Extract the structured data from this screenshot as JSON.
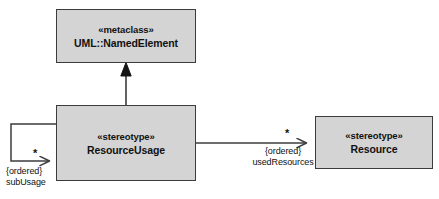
{
  "diagram": {
    "type": "uml-class-diagram",
    "colors": {
      "box_fill": "#d4d4d4",
      "box_stroke": "#3c3c3c",
      "line": "#3c3c3c",
      "text": "#111111",
      "background": "#ffffff"
    },
    "nodes": [
      {
        "id": "metaclass",
        "stereotype": "«metaclass»",
        "name": "UML::NamedElement"
      },
      {
        "id": "resourceusage",
        "stereotype": "«stereotype»",
        "name": "ResourceUsage"
      },
      {
        "id": "resource",
        "stereotype": "«stereotype»",
        "name": "Resource"
      }
    ],
    "edges": [
      {
        "id": "extension",
        "kind": "generalization",
        "from": "resourceusage",
        "to": "metaclass",
        "labels": []
      },
      {
        "id": "sub-usage",
        "kind": "association",
        "from": "resourceusage",
        "to": "resourceusage",
        "multiplicity": "*",
        "constraint": "{ordered}",
        "role": "subUsage"
      },
      {
        "id": "used-resources",
        "kind": "association",
        "from": "resourceusage",
        "to": "resource",
        "multiplicity": "*",
        "constraint": "{ordered}",
        "role": "usedResources"
      }
    ]
  }
}
